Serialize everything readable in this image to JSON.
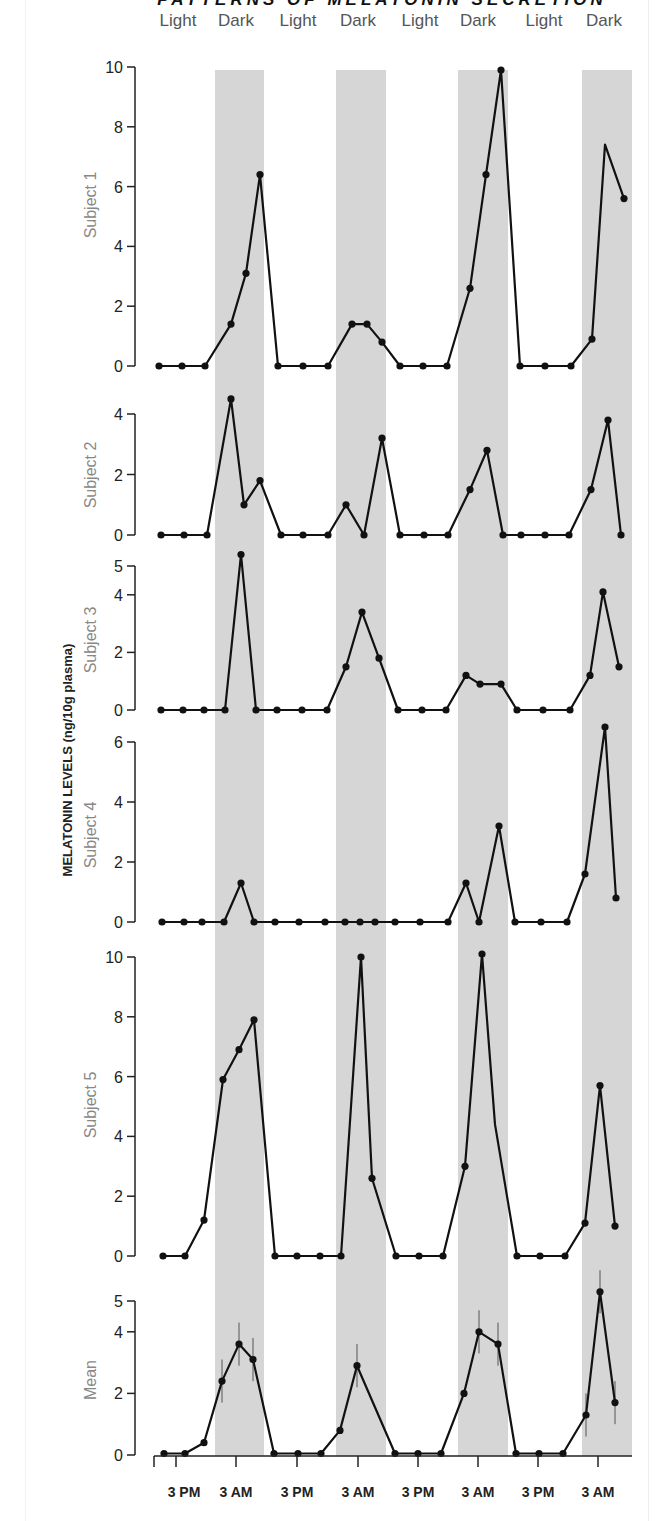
{
  "chart_data": {
    "type": "line",
    "title": "PATTERNS OF MELATONIN SECRETION",
    "ylabel": "MELATONIN LEVELS (ng/10g plasma)",
    "xlabel": "",
    "x_tick_labels": [
      "3 PM",
      "3 AM",
      "3 PM",
      "3 AM",
      "3 PM",
      "3 AM",
      "3 PM",
      "3 AM"
    ],
    "period_labels": [
      "Light",
      "Dark",
      "Light",
      "Dark",
      "Light",
      "Dark",
      "Light",
      "Dark"
    ],
    "dark_band_color": "#d6d6d6",
    "line_color": "#111111",
    "grid": false,
    "legend": null,
    "x_positions_px": [
      159,
      182,
      203,
      226,
      242,
      255,
      272,
      297,
      322,
      344,
      359,
      374,
      390,
      413,
      437,
      459,
      475,
      489,
      507,
      532,
      557,
      577,
      589,
      607
    ],
    "panels": [
      {
        "name": "Subject 1",
        "ylim": [
          0,
          10
        ],
        "yticks": [
          0,
          2,
          4,
          6,
          8,
          10
        ],
        "points": [
          {
            "x": 159,
            "y": 0
          },
          {
            "x": 182,
            "y": 0
          },
          {
            "x": 205,
            "y": 0
          },
          {
            "x": 231,
            "y": 1.4
          },
          {
            "x": 246,
            "y": 3.1
          },
          {
            "x": 260,
            "y": 6.4
          },
          {
            "x": 278,
            "y": 0
          },
          {
            "x": 303,
            "y": 0
          },
          {
            "x": 328,
            "y": 0
          },
          {
            "x": 352,
            "y": 1.4
          },
          {
            "x": 367,
            "y": 1.4
          },
          {
            "x": 382,
            "y": 0.8
          },
          {
            "x": 400,
            "y": 0
          },
          {
            "x": 423,
            "y": 0
          },
          {
            "x": 447,
            "y": 0
          },
          {
            "x": 470,
            "y": 2.6
          },
          {
            "x": 486,
            "y": 6.4
          },
          {
            "x": 501,
            "y": 9.9
          },
          {
            "x": 520,
            "y": 0
          },
          {
            "x": 545,
            "y": 0
          },
          {
            "x": 571,
            "y": 0
          },
          {
            "x": 592,
            "y": 0.9
          },
          {
            "x": 605,
            "y": 7.4,
            "marker": false
          },
          {
            "x": 624,
            "y": 5.6
          }
        ]
      },
      {
        "name": "Subject 2",
        "ylim": [
          0,
          4
        ],
        "yticks": [
          0,
          2,
          4
        ],
        "points": [
          {
            "x": 161,
            "y": 0
          },
          {
            "x": 184,
            "y": 0
          },
          {
            "x": 207,
            "y": 0
          },
          {
            "x": 231,
            "y": 4.5
          },
          {
            "x": 244,
            "y": 1.0
          },
          {
            "x": 260,
            "y": 1.8
          },
          {
            "x": 281,
            "y": 0
          },
          {
            "x": 303,
            "y": 0
          },
          {
            "x": 328,
            "y": 0
          },
          {
            "x": 346,
            "y": 1.0
          },
          {
            "x": 364,
            "y": 0
          },
          {
            "x": 382,
            "y": 3.2
          },
          {
            "x": 400,
            "y": 0
          },
          {
            "x": 424,
            "y": 0
          },
          {
            "x": 448,
            "y": 0
          },
          {
            "x": 470,
            "y": 1.5
          },
          {
            "x": 487,
            "y": 2.8
          },
          {
            "x": 503,
            "y": 0
          },
          {
            "x": 521,
            "y": 0
          },
          {
            "x": 545,
            "y": 0
          },
          {
            "x": 569,
            "y": 0
          },
          {
            "x": 591,
            "y": 1.5
          },
          {
            "x": 608,
            "y": 3.8
          },
          {
            "x": 621,
            "y": 0
          }
        ]
      },
      {
        "name": "Subject 3",
        "ylim": [
          0,
          5
        ],
        "yticks": [
          0,
          2,
          4,
          5
        ],
        "points": [
          {
            "x": 161,
            "y": 0
          },
          {
            "x": 183,
            "y": 0
          },
          {
            "x": 204,
            "y": 0
          },
          {
            "x": 225,
            "y": 0
          },
          {
            "x": 241,
            "y": 5.4
          },
          {
            "x": 256,
            "y": 0
          },
          {
            "x": 277,
            "y": 0
          },
          {
            "x": 302,
            "y": 0
          },
          {
            "x": 327,
            "y": 0
          },
          {
            "x": 346,
            "y": 1.5
          },
          {
            "x": 362,
            "y": 3.4
          },
          {
            "x": 379,
            "y": 1.8
          },
          {
            "x": 398,
            "y": 0
          },
          {
            "x": 422,
            "y": 0
          },
          {
            "x": 446,
            "y": 0
          },
          {
            "x": 466,
            "y": 1.2
          },
          {
            "x": 480,
            "y": 0.9
          },
          {
            "x": 501,
            "y": 0.9
          },
          {
            "x": 517,
            "y": 0
          },
          {
            "x": 543,
            "y": 0
          },
          {
            "x": 570,
            "y": 0
          },
          {
            "x": 590,
            "y": 1.2
          },
          {
            "x": 603,
            "y": 4.1
          },
          {
            "x": 619,
            "y": 1.5
          }
        ]
      },
      {
        "name": "Subject 4",
        "ylim": [
          0,
          6
        ],
        "yticks": [
          0,
          2,
          4,
          6
        ],
        "points": [
          {
            "x": 162,
            "y": 0
          },
          {
            "x": 184,
            "y": 0
          },
          {
            "x": 202,
            "y": 0
          },
          {
            "x": 224,
            "y": 0
          },
          {
            "x": 241,
            "y": 1.3
          },
          {
            "x": 254,
            "y": 0
          },
          {
            "x": 275,
            "y": 0
          },
          {
            "x": 299,
            "y": 0
          },
          {
            "x": 325,
            "y": 0
          },
          {
            "x": 345,
            "y": 0
          },
          {
            "x": 360,
            "y": 0
          },
          {
            "x": 375,
            "y": 0
          },
          {
            "x": 395,
            "y": 0
          },
          {
            "x": 420,
            "y": 0
          },
          {
            "x": 448,
            "y": 0
          },
          {
            "x": 466,
            "y": 1.3
          },
          {
            "x": 479,
            "y": 0
          },
          {
            "x": 499,
            "y": 3.2
          },
          {
            "x": 515,
            "y": 0
          },
          {
            "x": 541,
            "y": 0
          },
          {
            "x": 567,
            "y": 0
          },
          {
            "x": 585,
            "y": 1.6
          },
          {
            "x": 605,
            "y": 6.5
          },
          {
            "x": 616,
            "y": 0.8
          }
        ]
      },
      {
        "name": "Subject 5",
        "ylim": [
          0,
          10
        ],
        "yticks": [
          0,
          2,
          4,
          6,
          8,
          10
        ],
        "points": [
          {
            "x": 163,
            "y": 0
          },
          {
            "x": 185,
            "y": 0
          },
          {
            "x": 204,
            "y": 1.2
          },
          {
            "x": 223,
            "y": 5.9
          },
          {
            "x": 239,
            "y": 6.9
          },
          {
            "x": 254,
            "y": 7.9
          },
          {
            "x": 275,
            "y": 0
          },
          {
            "x": 297,
            "y": 0
          },
          {
            "x": 320,
            "y": 0
          },
          {
            "x": 341,
            "y": 0
          },
          {
            "x": 361,
            "y": 10.0
          },
          {
            "x": 372,
            "y": 2.6
          },
          {
            "x": 396,
            "y": 0
          },
          {
            "x": 419,
            "y": 0
          },
          {
            "x": 443,
            "y": 0
          },
          {
            "x": 465,
            "y": 3.0
          },
          {
            "x": 482,
            "y": 10.1
          },
          {
            "x": 495,
            "y": 4.4,
            "marker": false
          },
          {
            "x": 517,
            "y": 0
          },
          {
            "x": 540,
            "y": 0
          },
          {
            "x": 565,
            "y": 0
          },
          {
            "x": 585,
            "y": 1.1
          },
          {
            "x": 600,
            "y": 5.7
          },
          {
            "x": 615,
            "y": 1.0
          }
        ]
      },
      {
        "name": "Mean",
        "ylim": [
          0,
          5
        ],
        "yticks": [
          0,
          2,
          4,
          5
        ],
        "error_bars": true,
        "points": [
          {
            "x": 164,
            "y": 0.05
          },
          {
            "x": 185,
            "y": 0.05
          },
          {
            "x": 204,
            "y": 0.4
          },
          {
            "x": 222,
            "y": 2.4,
            "err": 0.7
          },
          {
            "x": 239,
            "y": 3.6,
            "err": 0.7
          },
          {
            "x": 253,
            "y": 3.1,
            "err": 0.7
          },
          {
            "x": 274,
            "y": 0.05
          },
          {
            "x": 298,
            "y": 0.05
          },
          {
            "x": 321,
            "y": 0.05
          },
          {
            "x": 340,
            "y": 0.8
          },
          {
            "x": 357,
            "y": 2.9,
            "err": 0.7
          },
          {
            "x": 395,
            "y": 0.05
          },
          {
            "x": 418,
            "y": 0.05
          },
          {
            "x": 441,
            "y": 0.05
          },
          {
            "x": 464,
            "y": 2.0
          },
          {
            "x": 479,
            "y": 4.0,
            "err": 0.7
          },
          {
            "x": 498,
            "y": 3.6,
            "err": 0.7
          },
          {
            "x": 516,
            "y": 0.05
          },
          {
            "x": 539,
            "y": 0.05
          },
          {
            "x": 563,
            "y": 0.05
          },
          {
            "x": 586,
            "y": 1.3,
            "err": 0.7
          },
          {
            "x": 600,
            "y": 5.3,
            "err": 0.7
          },
          {
            "x": 615,
            "y": 1.7,
            "err": 0.7
          }
        ]
      }
    ]
  }
}
